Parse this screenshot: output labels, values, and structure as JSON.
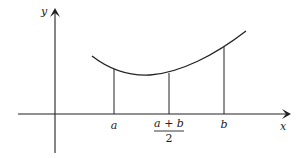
{
  "diagram": {
    "type": "function-graph",
    "axes": {
      "x_label": "x",
      "y_label": "y"
    },
    "curve": {
      "description": "convex curve above x-axis, decreasing then increasing"
    },
    "markers": [
      {
        "id": "a",
        "label": "a"
      },
      {
        "id": "midpoint",
        "numerator": "a + b",
        "denominator": "2"
      },
      {
        "id": "b",
        "label": "b"
      }
    ],
    "colors": {
      "stroke": "#222222",
      "background": "#ffffff"
    }
  }
}
